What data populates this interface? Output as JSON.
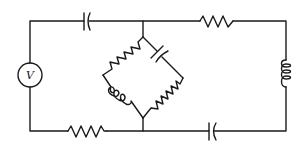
{
  "diagram": {
    "type": "circuit-schematic",
    "stroke_color": "#1a1a1a",
    "background": "#ffffff",
    "source": {
      "symbol": "voltage-source",
      "label": "V"
    },
    "components": [
      {
        "id": "C1",
        "type": "capacitor",
        "location": "top-left branch"
      },
      {
        "id": "R1",
        "type": "resistor",
        "location": "top-right branch"
      },
      {
        "id": "L1",
        "type": "inductor",
        "location": "right branch"
      },
      {
        "id": "C2",
        "type": "capacitor",
        "location": "bottom-right branch"
      },
      {
        "id": "R2",
        "type": "resistor",
        "location": "bottom-left branch"
      },
      {
        "id": "R3",
        "type": "resistor",
        "location": "bridge upper-left arm"
      },
      {
        "id": "C3",
        "type": "capacitor",
        "location": "bridge upper-right arm"
      },
      {
        "id": "L2",
        "type": "inductor",
        "location": "bridge lower-left arm"
      },
      {
        "id": "R4",
        "type": "resistor",
        "location": "bridge lower-right arm"
      }
    ]
  }
}
